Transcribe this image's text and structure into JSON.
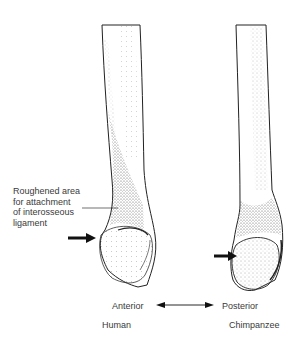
{
  "figure": {
    "callout": {
      "line1": "Roughened area",
      "line2": "for attachment",
      "line3": "of interosseous",
      "line4": "ligament"
    },
    "axis": {
      "left_label": "Anterior",
      "right_label": "Posterior"
    },
    "specimens": [
      {
        "label": "Human"
      },
      {
        "label": "Chimpanzee"
      }
    ]
  }
}
